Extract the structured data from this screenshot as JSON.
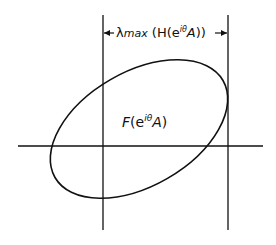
{
  "diagram": {
    "width_label": {
      "symbol": "λ",
      "sub": "max",
      "open": " (H(e",
      "exp": "iθ",
      "mid": "A",
      "close": "))"
    },
    "region_label": {
      "func": "F",
      "open": "(e",
      "exp": "iθ",
      "mid": "A",
      "close": ")"
    },
    "stroke_color": "#111111",
    "background_color": "#ffffff"
  }
}
